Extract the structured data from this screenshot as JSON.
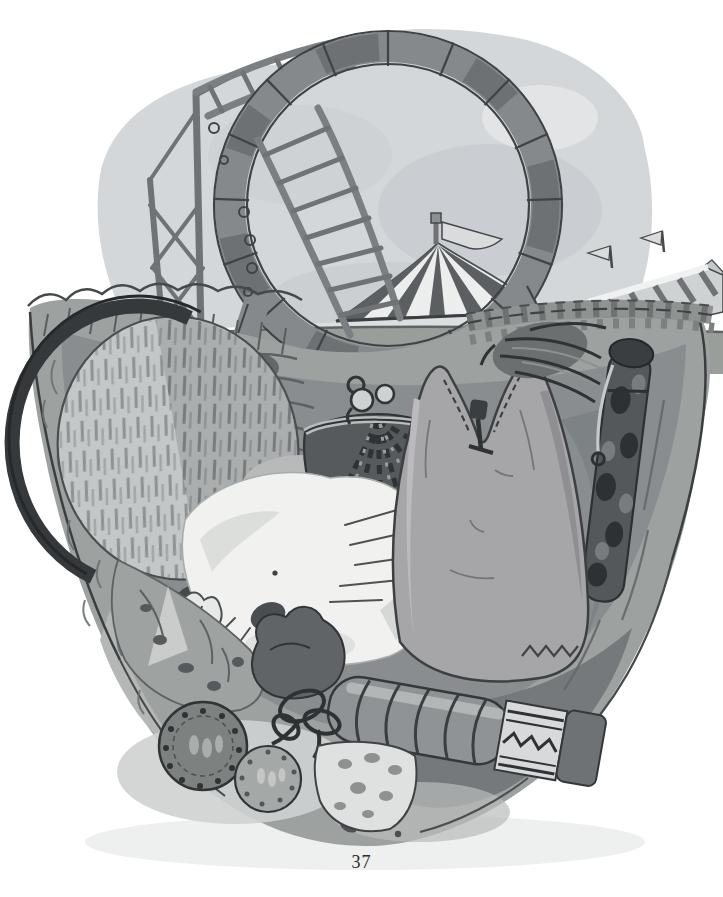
{
  "page": {
    "number": "37",
    "background_color": "#ffffff"
  },
  "illustration": {
    "alt": "Ink and gray watercolor illustration: looking down into a packed travel basket containing a scrubbing brush, a clasp purse, a white furry animal, a hot-water bottle, a fountain pen, a thermos flask, cord, a dark pouch, two clove-studded oranges and spotted cloth; behind the basket a fairground with a roller-coaster loop, ladder track on scaffolding, a striped circus big top with a pennant flag and a striped sideshow awning with small flags.",
    "style": "pen-and-ink with gray wash, book plate",
    "palette": {
      "paper": "#ffffff",
      "sky_wash": "#d4d7d9",
      "cloud_shade": "#c8ccd0",
      "ink_dark": "#2f3335",
      "track_gray": "#85898b",
      "ground_gray": "#999e9b",
      "basket_gray": "#9da1a0",
      "interior_shadow": "#898d8f",
      "bottom_wash_dark": "#73777a",
      "white_fur": "#f1f2f0",
      "bottle_gray": "#a6a6a9",
      "purse_dark": "#565a5c",
      "tent_light": "#eceded",
      "tent_stripe": "#5b5f61",
      "bristle_light": "#c4c7c7"
    },
    "background_elements": [
      {
        "name": "sky-wash",
        "label": "overcast sky wash"
      },
      {
        "name": "support-scaffold",
        "label": "wooden support scaffold with cross bracing"
      },
      {
        "name": "ladder-track-upper",
        "label": "upper ladder track section"
      },
      {
        "name": "roller-coaster-loop",
        "label": "roller-coaster vertical loop"
      },
      {
        "name": "ladder-track-descending",
        "label": "descending ladder track through loop"
      },
      {
        "name": "circus-big-top",
        "label": "striped circus big top tent"
      },
      {
        "name": "tent-pennant-flag",
        "label": "pennant flag on tent pole"
      },
      {
        "name": "sideshow-awning",
        "label": "striped sideshow awning with two small flags"
      },
      {
        "name": "fairground-ground",
        "label": "gray-green fairground field"
      }
    ],
    "basket_elements": [
      {
        "name": "basket-body",
        "label": "large woven travel basket seen from above"
      },
      {
        "name": "basket-rim-left",
        "label": "bumpy wicker rim, left side"
      },
      {
        "name": "basket-rim-rope",
        "label": "braided rope rim, right side"
      },
      {
        "name": "rope-knot-left",
        "label": "rope lashing where left loop leg meets rim"
      },
      {
        "name": "rope-knot-right",
        "label": "frayed rope knot where right loop leg meets rim"
      },
      {
        "name": "scrubbing-brush",
        "label": "round scrubbing brush, bristles up"
      },
      {
        "name": "clasp-purse",
        "label": "dark plaid kiss-lock coin purse"
      },
      {
        "name": "white-furry-animal",
        "label": "white furry animal curled with whiskers"
      },
      {
        "name": "hot-water-bottle",
        "label": "two-lobed hot-water bottle with stopper"
      },
      {
        "name": "fountain-pen",
        "label": "marbled fountain pen with clip"
      },
      {
        "name": "thermos-flask",
        "label": "ribbed thermos flask with patterned band"
      },
      {
        "name": "cord-bow",
        "label": "looped cord tied in a bow"
      },
      {
        "name": "dark-pouch",
        "label": "small dark pouch"
      },
      {
        "name": "clove-orange-large",
        "label": "large clove-studded orange"
      },
      {
        "name": "clove-orange-small",
        "label": "small clove-studded orange"
      },
      {
        "name": "spotted-cloth",
        "label": "folded spotted cloth"
      },
      {
        "name": "polka-dot-cloth",
        "label": "pale polka-dot cloth at basket bottom"
      }
    ]
  }
}
